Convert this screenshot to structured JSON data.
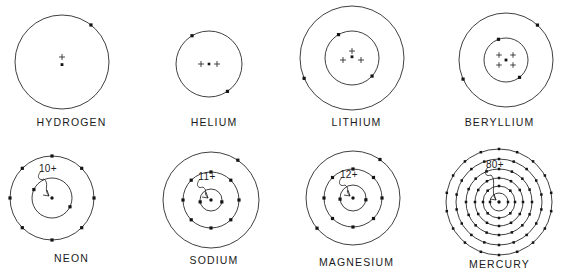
{
  "figure": {
    "background_color": "#ffffff",
    "ink_color": "#1b1b1b",
    "columns": 4,
    "rows": 2
  },
  "atoms": [
    {
      "id": "hydrogen",
      "label": "HYDROGEN",
      "atomic_number": 1,
      "nucleus_notation": "plus-with-dot",
      "nucleus_charge_label": "",
      "nucleus_plus_count": 1,
      "shells": [
        {
          "radius": 47,
          "electrons": 1,
          "electron_angles": [
            -52
          ]
        }
      ],
      "cx": 62,
      "cy": 62,
      "label_y": 116,
      "cell": {
        "x": 0,
        "y": 0,
        "w": 143,
        "h": 140
      }
    },
    {
      "id": "helium",
      "label": "HELIUM",
      "atomic_number": 2,
      "nucleus_notation": "plus-dot-plus",
      "nucleus_charge_label": "",
      "nucleus_plus_count": 2,
      "shells": [
        {
          "radius": 33,
          "electrons": 2,
          "electron_angles": [
            -121,
            56
          ]
        }
      ],
      "cx": 66,
      "cy": 64,
      "label_y": 116,
      "cell": {
        "x": 143,
        "y": 0,
        "w": 142,
        "h": 140
      }
    },
    {
      "id": "lithium",
      "label": "LITHIUM",
      "atomic_number": 3,
      "nucleus_notation": "triangle-three-plus",
      "nucleus_charge_label": "",
      "nucleus_plus_count": 3,
      "shells": [
        {
          "radius": 27,
          "electrons": 2,
          "electron_angles": [
            -120,
            42
          ]
        },
        {
          "radius": 52,
          "electrons": 1,
          "electron_angles": [
            157
          ]
        }
      ],
      "cx": 67,
      "cy": 58,
      "label_y": 116,
      "cell": {
        "x": 285,
        "y": 0,
        "w": 143,
        "h": 140
      }
    },
    {
      "id": "beryllium",
      "label": "BERYLLIUM",
      "atomic_number": 4,
      "nucleus_notation": "square-four-plus",
      "nucleus_charge_label": "",
      "nucleus_plus_count": 4,
      "shells": [
        {
          "radius": 22,
          "electrons": 2,
          "electron_angles": [
            -110,
            52
          ]
        },
        {
          "radius": 47,
          "electrons": 2,
          "electron_angles": [
            -48,
            156
          ]
        }
      ],
      "cx": 78,
      "cy": 60,
      "label_y": 116,
      "cell": {
        "x": 428,
        "y": 0,
        "w": 143,
        "h": 140
      }
    },
    {
      "id": "neon",
      "label": "NEON",
      "atomic_number": 10,
      "nucleus_notation": "charge-label",
      "nucleus_charge_label": "10+",
      "nucleus_plus_count": 0,
      "shells": [
        {
          "radius": 20,
          "electrons": 2,
          "electron_angles": [
            -155,
            26
          ]
        },
        {
          "radius": 42,
          "electrons": 8,
          "electron_angles": [
            -90,
            -45,
            0,
            45,
            90,
            135,
            180,
            -135
          ]
        }
      ],
      "cx": 52,
      "cy": 58,
      "label_y": 112,
      "cell": {
        "x": 0,
        "y": 140,
        "w": 143,
        "h": 140
      }
    },
    {
      "id": "sodium",
      "label": "SODIUM",
      "atomic_number": 11,
      "nucleus_notation": "charge-label",
      "nucleus_charge_label": "11+",
      "nucleus_plus_count": 0,
      "shells": [
        {
          "radius": 11,
          "electrons": 2,
          "electron_angles": [
            170,
            10
          ]
        },
        {
          "radius": 28,
          "electrons": 8,
          "electron_angles": [
            -90,
            -45,
            0,
            45,
            90,
            135,
            180,
            -135
          ]
        },
        {
          "radius": 48,
          "electrons": 1,
          "electron_angles": [
            -56
          ]
        }
      ],
      "cx": 68,
      "cy": 60,
      "label_y": 114,
      "cell": {
        "x": 143,
        "y": 140,
        "w": 142,
        "h": 140
      }
    },
    {
      "id": "magnesium",
      "label": "MAGNESIUM",
      "atomic_number": 12,
      "nucleus_notation": "charge-label",
      "nucleus_charge_label": "12+",
      "nucleus_plus_count": 0,
      "shells": [
        {
          "radius": 13,
          "electrons": 2,
          "electron_angles": [
            175,
            8
          ]
        },
        {
          "radius": 29,
          "electrons": 8,
          "electron_angles": [
            -90,
            -45,
            0,
            45,
            90,
            135,
            180,
            -135
          ]
        },
        {
          "radius": 47,
          "electrons": 2,
          "electron_angles": [
            -55,
            140
          ]
        }
      ],
      "cx": 68,
      "cy": 58,
      "label_y": 116,
      "cell": {
        "x": 285,
        "y": 140,
        "w": 143,
        "h": 140
      }
    },
    {
      "id": "mercury",
      "label": "MERCURY",
      "atomic_number": 80,
      "nucleus_notation": "charge-label",
      "nucleus_charge_label": "80+",
      "nucleus_plus_count": 0,
      "shells": [
        {
          "radius": 9,
          "electrons": 2,
          "electron_angles": [
            180,
            0
          ]
        },
        {
          "radius": 16,
          "electrons": 8,
          "electron_angles": [
            -90,
            -45,
            0,
            45,
            90,
            135,
            180,
            -135
          ]
        },
        {
          "radius": 24,
          "electrons": 12,
          "electron_angles": [
            -90,
            -60,
            -30,
            0,
            30,
            60,
            90,
            120,
            150,
            180,
            -150,
            -120
          ]
        },
        {
          "radius": 33,
          "electrons": 16,
          "electron_angles": [
            -90,
            -67,
            -45,
            -22,
            0,
            22,
            45,
            67,
            90,
            112,
            135,
            157,
            180,
            -157,
            -135,
            -112
          ]
        },
        {
          "radius": 43,
          "electrons": 18,
          "electron_angles": [
            -90,
            -70,
            -50,
            -30,
            -10,
            10,
            30,
            50,
            70,
            90,
            110,
            130,
            150,
            170,
            -170,
            -150,
            -130,
            -110
          ]
        },
        {
          "radius": 53,
          "electrons": 18,
          "electron_angles": [
            -90,
            -70,
            -50,
            -30,
            -10,
            10,
            30,
            50,
            70,
            90,
            110,
            130,
            150,
            170,
            -170,
            -150,
            -130,
            -110
          ]
        }
      ],
      "cx": 71,
      "cy": 62,
      "label_y": 118,
      "cell": {
        "x": 428,
        "y": 140,
        "w": 143,
        "h": 140
      }
    }
  ]
}
